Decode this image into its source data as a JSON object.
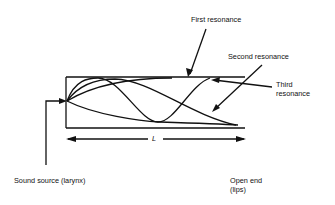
{
  "diagram": {
    "labels": {
      "first": "First resonance",
      "second": "Second resonance",
      "third_line1": "Third",
      "third_line2": "resonance",
      "length": "L",
      "source": "Sound source (larynx)",
      "open_line1": "Open end",
      "open_line2": "(lips)"
    },
    "colors": {
      "ink": "#111111",
      "background": "#ffffff"
    }
  }
}
